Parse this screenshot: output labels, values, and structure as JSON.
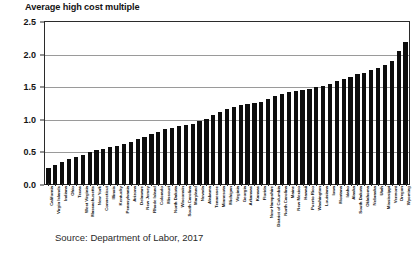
{
  "chart_data": {
    "type": "bar",
    "title": "Average high cost multiple",
    "xlabel": "",
    "ylabel": "",
    "ylim": [
      0.0,
      2.5
    ],
    "yticks": [
      "0.0",
      "0.5",
      "1.0",
      "1.5",
      "2.0",
      "2.5"
    ],
    "ytick_values": [
      0.0,
      0.5,
      1.0,
      1.5,
      2.0,
      2.5
    ],
    "grid": true,
    "legend": "none",
    "bar_color": "#0d0d0d",
    "source": "Source:  Department of Labor, 2017",
    "categories": [
      "California",
      "Virgin Islands",
      "Indiana",
      "Ohio",
      "Texas",
      "West Virginia",
      "Massachusetts",
      "New York",
      "Connecticut",
      "Illinois",
      "Kentucky",
      "Pennsylvania",
      "Arizona",
      "Delaware",
      "New Jersey",
      "Rhode Island",
      "Colorado",
      "Missouri",
      "North Dakota",
      "Wisconsin",
      "South Carolina",
      "Maryland",
      "Nevada",
      "Alabama",
      "Tennessee",
      "Minnesota",
      "Michigan",
      "Virginia",
      "Georgia",
      "Arkansas",
      "Kansas",
      "Florida",
      "New Hampshire",
      "District of Columbia",
      "North Carolina",
      "Maine",
      "New Mexico",
      "Hawaii",
      "Puerto Rico",
      "Washington",
      "Louisiana",
      "Iowa",
      "Montana",
      "Idaho",
      "Alaska",
      "South Dakota",
      "Oklahoma",
      "Nebraska",
      "Utah",
      "Mississippi",
      "Vermont",
      "Oregon",
      "Wyoming"
    ],
    "values": [
      0.26,
      0.3,
      0.36,
      0.4,
      0.43,
      0.46,
      0.5,
      0.53,
      0.56,
      0.58,
      0.6,
      0.63,
      0.66,
      0.7,
      0.74,
      0.78,
      0.82,
      0.86,
      0.88,
      0.9,
      0.92,
      0.94,
      0.98,
      1.02,
      1.08,
      1.12,
      1.16,
      1.2,
      1.22,
      1.24,
      1.26,
      1.28,
      1.32,
      1.36,
      1.4,
      1.42,
      1.44,
      1.46,
      1.48,
      1.5,
      1.52,
      1.55,
      1.6,
      1.63,
      1.66,
      1.7,
      1.72,
      1.76,
      1.8,
      1.84,
      1.9,
      2.05,
      2.2
    ]
  }
}
